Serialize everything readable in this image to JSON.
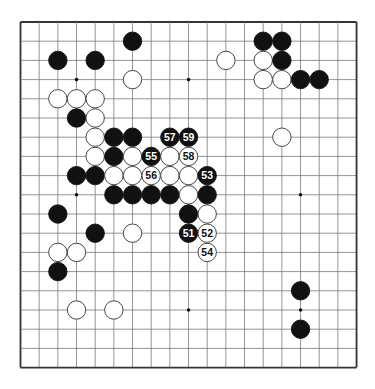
{
  "board": {
    "size": 19,
    "origin_x": 20.5,
    "origin_y": 22,
    "spacing_x": 18.67,
    "spacing_y": 19.2,
    "stone_radius": 9.2,
    "line_color": "#7a7a7a",
    "border_color": "#333333",
    "black_color": "#111111",
    "white_color": "#ffffff",
    "star_points": [
      [
        3,
        3
      ],
      [
        9,
        3
      ],
      [
        15,
        3
      ],
      [
        3,
        9
      ],
      [
        9,
        9
      ],
      [
        15,
        9
      ],
      [
        3,
        15
      ],
      [
        9,
        15
      ],
      [
        15,
        15
      ]
    ]
  },
  "stones": [
    {
      "color": "black",
      "col": 6,
      "row": 1
    },
    {
      "color": "black",
      "col": 13,
      "row": 1
    },
    {
      "color": "black",
      "col": 14,
      "row": 1
    },
    {
      "color": "black",
      "col": 2,
      "row": 2
    },
    {
      "color": "black",
      "col": 4,
      "row": 2
    },
    {
      "color": "white",
      "col": 11,
      "row": 2
    },
    {
      "color": "white",
      "col": 13,
      "row": 2
    },
    {
      "color": "black",
      "col": 14,
      "row": 2
    },
    {
      "color": "white",
      "col": 6,
      "row": 3
    },
    {
      "color": "white",
      "col": 13,
      "row": 3
    },
    {
      "color": "white",
      "col": 14,
      "row": 3
    },
    {
      "color": "black",
      "col": 15,
      "row": 3
    },
    {
      "color": "black",
      "col": 16,
      "row": 3
    },
    {
      "color": "white",
      "col": 2,
      "row": 4
    },
    {
      "color": "white",
      "col": 3,
      "row": 4
    },
    {
      "color": "white",
      "col": 4,
      "row": 4
    },
    {
      "color": "black",
      "col": 3,
      "row": 5
    },
    {
      "color": "white",
      "col": 4,
      "row": 5
    },
    {
      "color": "white",
      "col": 4,
      "row": 6
    },
    {
      "color": "black",
      "col": 5,
      "row": 6
    },
    {
      "color": "black",
      "col": 6,
      "row": 6
    },
    {
      "color": "black",
      "col": 8,
      "row": 6,
      "label": "57"
    },
    {
      "color": "black",
      "col": 9,
      "row": 6,
      "label": "59"
    },
    {
      "color": "white",
      "col": 14,
      "row": 6
    },
    {
      "color": "white",
      "col": 4,
      "row": 7
    },
    {
      "color": "black",
      "col": 5,
      "row": 7
    },
    {
      "color": "white",
      "col": 6,
      "row": 7
    },
    {
      "color": "black",
      "col": 7,
      "row": 7,
      "label": "55"
    },
    {
      "color": "white",
      "col": 8,
      "row": 7
    },
    {
      "color": "white",
      "col": 9,
      "row": 7,
      "label": "58"
    },
    {
      "color": "black",
      "col": 3,
      "row": 8
    },
    {
      "color": "black",
      "col": 4,
      "row": 8
    },
    {
      "color": "white",
      "col": 5,
      "row": 8
    },
    {
      "color": "white",
      "col": 6,
      "row": 8
    },
    {
      "color": "white",
      "col": 7,
      "row": 8,
      "label": "56"
    },
    {
      "color": "white",
      "col": 8,
      "row": 8
    },
    {
      "color": "white",
      "col": 9,
      "row": 8
    },
    {
      "color": "black",
      "col": 10,
      "row": 8,
      "label": "53"
    },
    {
      "color": "black",
      "col": 5,
      "row": 9
    },
    {
      "color": "black",
      "col": 6,
      "row": 9
    },
    {
      "color": "black",
      "col": 7,
      "row": 9
    },
    {
      "color": "black",
      "col": 8,
      "row": 9
    },
    {
      "color": "white",
      "col": 9,
      "row": 9
    },
    {
      "color": "black",
      "col": 10,
      "row": 9
    },
    {
      "color": "black",
      "col": 2,
      "row": 10
    },
    {
      "color": "black",
      "col": 9,
      "row": 10
    },
    {
      "color": "white",
      "col": 10,
      "row": 10
    },
    {
      "color": "black",
      "col": 4,
      "row": 11
    },
    {
      "color": "white",
      "col": 6,
      "row": 11
    },
    {
      "color": "black",
      "col": 9,
      "row": 11,
      "label": "51"
    },
    {
      "color": "white",
      "col": 10,
      "row": 11,
      "label": "52"
    },
    {
      "color": "white",
      "col": 2,
      "row": 12
    },
    {
      "color": "white",
      "col": 3,
      "row": 12
    },
    {
      "color": "white",
      "col": 10,
      "row": 12,
      "label": "54"
    },
    {
      "color": "black",
      "col": 2,
      "row": 13
    },
    {
      "color": "black",
      "col": 15,
      "row": 14
    },
    {
      "color": "white",
      "col": 3,
      "row": 15
    },
    {
      "color": "white",
      "col": 5,
      "row": 15
    },
    {
      "color": "black",
      "col": 15,
      "row": 16
    }
  ]
}
